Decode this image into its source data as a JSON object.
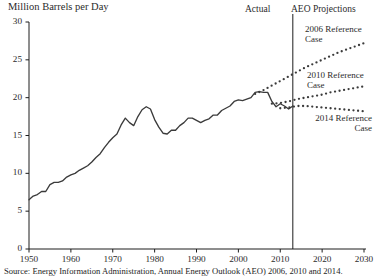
{
  "axis_title": "Million Barrels per Day",
  "annotations": {
    "actual": "Actual",
    "aeo_projections": "AEO Projections",
    "ref2006": "2006 Reference\nCase",
    "ref2010": "2010 Reference\nCase",
    "ref2014": "2014 Reference\nCase"
  },
  "source": "Source: Energy Information Administration, Annual Energy Outlook (AEO) 2006, 2010 and 2014.",
  "colors": {
    "line": "#3b3b3b",
    "axis": "#1c1c1c",
    "text": "#2b2b2b",
    "background": "#ffffff"
  },
  "chart_data": {
    "type": "line",
    "title": "",
    "xlabel": "",
    "ylabel": "Million Barrels per Day",
    "xlim": [
      1950,
      2030
    ],
    "ylim": [
      0,
      30
    ],
    "yticks": [
      0,
      5,
      10,
      15,
      20,
      25,
      30
    ],
    "xticks": [
      1950,
      1960,
      1970,
      1980,
      1990,
      2000,
      2010,
      2020,
      2030
    ],
    "grid": false,
    "legend": "inline-annotations",
    "divider_year": 2013,
    "series": [
      {
        "name": "Actual",
        "style": "solid",
        "x": [
          1950,
          1951,
          1952,
          1953,
          1954,
          1955,
          1956,
          1957,
          1958,
          1959,
          1960,
          1961,
          1962,
          1963,
          1964,
          1965,
          1966,
          1967,
          1968,
          1969,
          1970,
          1971,
          1972,
          1973,
          1974,
          1975,
          1976,
          1977,
          1978,
          1979,
          1980,
          1981,
          1982,
          1983,
          1984,
          1985,
          1986,
          1987,
          1988,
          1989,
          1990,
          1991,
          1992,
          1993,
          1994,
          1995,
          1996,
          1997,
          1998,
          1999,
          2000,
          2001,
          2002,
          2003,
          2004,
          2005,
          2006,
          2007,
          2008,
          2009,
          2010,
          2011,
          2012,
          2013
        ],
        "values": [
          6.5,
          7.0,
          7.2,
          7.6,
          7.6,
          8.5,
          8.8,
          8.8,
          9.0,
          9.5,
          9.8,
          10.0,
          10.4,
          10.7,
          11.0,
          11.5,
          12.1,
          12.6,
          13.4,
          14.1,
          14.7,
          15.2,
          16.4,
          17.3,
          16.7,
          16.3,
          17.5,
          18.4,
          18.8,
          18.5,
          17.1,
          16.1,
          15.3,
          15.2,
          15.7,
          15.7,
          16.3,
          16.7,
          17.3,
          17.3,
          17.0,
          16.7,
          17.0,
          17.2,
          17.7,
          17.7,
          18.3,
          18.6,
          18.9,
          19.5,
          19.7,
          19.6,
          19.8,
          20.0,
          20.7,
          20.8,
          20.7,
          20.7,
          19.5,
          18.8,
          19.2,
          18.9,
          18.5,
          18.9
        ]
      },
      {
        "name": "2006 Reference Case",
        "style": "dotted",
        "x": [
          2004,
          2006,
          2008,
          2010,
          2012,
          2014,
          2016,
          2018,
          2020,
          2022,
          2024,
          2026,
          2028,
          2030
        ],
        "values": [
          20.5,
          21.0,
          21.6,
          22.2,
          22.8,
          23.4,
          24.0,
          24.5,
          25.0,
          25.5,
          26.0,
          26.4,
          26.8,
          27.2
        ]
      },
      {
        "name": "2010 Reference Case",
        "style": "dotted",
        "x": [
          2008,
          2010,
          2012,
          2014,
          2016,
          2018,
          2020,
          2022,
          2024,
          2026,
          2028,
          2030
        ],
        "values": [
          19.2,
          19.3,
          19.5,
          19.8,
          20.0,
          20.2,
          20.4,
          20.7,
          20.9,
          21.1,
          21.3,
          21.5
        ]
      },
      {
        "name": "2014 Reference Case",
        "style": "dotted",
        "x": [
          2010,
          2012,
          2013,
          2014,
          2016,
          2018,
          2020,
          2022,
          2024,
          2026,
          2028,
          2030
        ],
        "values": [
          18.6,
          18.7,
          18.8,
          18.9,
          18.9,
          18.8,
          18.7,
          18.6,
          18.5,
          18.4,
          18.3,
          18.2
        ]
      }
    ]
  }
}
